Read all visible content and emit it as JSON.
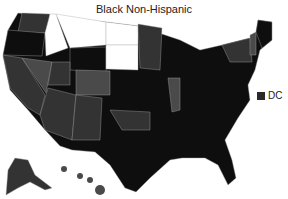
{
  "title": "Black Non-Hispanic",
  "legend": {
    "label": "DC",
    "color": "#2a2a2a"
  },
  "colors": {
    "darkest": "#0e0e0e",
    "dark": "#1c1c1c",
    "mid": "#333333",
    "light": "#4a4a4a",
    "white": "#ffffff",
    "border": "#aaaaaa"
  },
  "states": [
    {
      "id": "WA",
      "shade": "mid",
      "points": "22,13 50,14 48,33 18,32"
    },
    {
      "id": "OR",
      "shade": "darkest",
      "points": "8,30 45,33 42,56 3,55"
    },
    {
      "id": "CA",
      "shade": "mid",
      "points": "3,55 22,58 45,95 40,115 28,108 10,88"
    },
    {
      "id": "NV",
      "shade": "light",
      "points": "22,58 52,62 46,93"
    },
    {
      "id": "ID",
      "shade": "white",
      "points": "50,14 56,14 68,48 46,56 45,33"
    },
    {
      "id": "MT",
      "shade": "white",
      "points": "56,14 106,22 106,45 70,48"
    },
    {
      "id": "WY",
      "shade": "darkest",
      "points": "70,48 106,47 106,72 70,70"
    },
    {
      "id": "UT",
      "shade": "mid",
      "points": "52,62 70,62 70,85 48,85"
    },
    {
      "id": "CO",
      "shade": "light",
      "points": "76,70 110,71 110,95 76,95"
    },
    {
      "id": "AZ",
      "shade": "mid",
      "points": "48,88 76,95 72,140 45,130 40,115"
    },
    {
      "id": "NM",
      "shade": "mid",
      "points": "76,95 102,98 100,140 72,140"
    },
    {
      "id": "ND",
      "shade": "white",
      "points": "106,22 138,26 138,45 106,45"
    },
    {
      "id": "SD",
      "shade": "white",
      "points": "106,45 138,45 138,70 106,69"
    },
    {
      "id": "MN",
      "shade": "mid",
      "points": "138,24 162,28 160,70 140,68"
    },
    {
      "id": "OK",
      "shade": "mid",
      "points": "110,110 150,112 150,130 122,130"
    },
    {
      "id": "IL",
      "shade": "light",
      "points": "168,78 180,78 180,110 172,112"
    },
    {
      "id": "NY",
      "shade": "mid",
      "points": "222,45 250,38 252,62 230,62"
    },
    {
      "id": "VT",
      "shade": "light",
      "points": "250,35 256,32 256,55 250,55"
    },
    {
      "id": "ME",
      "shade": "darkest",
      "points": "258,20 272,22 272,40 262,48 256,32"
    },
    {
      "id": "HI",
      "shade": "light",
      "points": "62,168 108,195"
    }
  ],
  "nation": {
    "id": "US",
    "shade": "darkest",
    "points": "18,13 106,22 138,26 180,40 200,50 222,45 250,38 256,32 258,20 272,22 272,40 260,50 255,70 248,85 250,100 238,118 225,140 232,160 236,178 228,185 218,165 205,158 182,158 170,160 150,178 136,192 125,188 110,165 95,152 72,150 60,146 45,130 28,110 10,90 3,56 8,30"
  },
  "alaska": {
    "shade": "mid",
    "points": "8,170 15,158 28,160 35,175 52,188 45,190 30,182 18,188 6,195"
  }
}
